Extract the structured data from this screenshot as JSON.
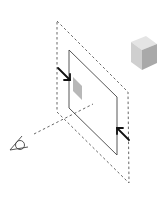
{
  "diagram": {
    "colors": {
      "background": "#ffffff",
      "dashed_line": "#555555",
      "plane_outline": "#444444",
      "arrow": "#111111",
      "patch": "#b8b8b8",
      "cube_top": "#e4e4e4",
      "cube_left": "#cfcfcf",
      "cube_right": "#a9a9a9",
      "eye": "#444444"
    },
    "elements": {
      "outer_plane": "dashed-parallelogram",
      "inner_plane": "solid-parallelogram",
      "projected_patch": "gray-parallelogram",
      "cube": "shaded-cube",
      "eye": "eye-symbol",
      "sight_line": "dashed-line",
      "arrows": [
        "arrow-upper-left",
        "arrow-lower-right"
      ]
    }
  }
}
